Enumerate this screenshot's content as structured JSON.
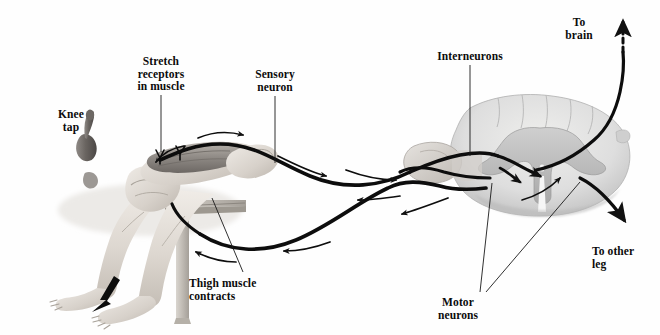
{
  "figure": {
    "background_color": "#fefefe",
    "width": 660,
    "height": 335,
    "ink_color": "#111111",
    "tissue_fill": "#d8d8d8",
    "tissue_shade": "#b4b4b4",
    "skin_fill": "#e3e0dc"
  },
  "labels": [
    {
      "id": "knee-tap",
      "text": "Knee\ntap",
      "x": 70,
      "y": 108,
      "align": "center",
      "leader": "none"
    },
    {
      "id": "stretch-receptors",
      "text": "Stretch\nreceptors\nin muscle",
      "x": 129,
      "y": 55,
      "align": "center",
      "leader": "vertical-down"
    },
    {
      "id": "sensory-neuron",
      "text": "Sensory\nneuron",
      "x": 248,
      "y": 68,
      "align": "center",
      "leader": "vertical-down"
    },
    {
      "id": "interneurons",
      "text": "Interneurons",
      "x": 437,
      "y": 50,
      "align": "center",
      "leader": "vertical-down"
    },
    {
      "id": "to-brain",
      "text": "To\nbrain",
      "x": 568,
      "y": 16,
      "align": "center",
      "leader": "dashed-arrow-up"
    },
    {
      "id": "to-other-leg",
      "text": "To other\nleg",
      "x": 592,
      "y": 245,
      "align": "left",
      "leader": "arrow-down-right"
    },
    {
      "id": "motor-neurons",
      "text": "Motor\nneurons",
      "x": 446,
      "y": 296,
      "align": "center",
      "leader": "two-lines-up"
    },
    {
      "id": "thigh-muscle-contracts",
      "text": "Thigh muscle\ncontracts",
      "x": 189,
      "y": 277,
      "align": "left",
      "leader": "diagonal-up-right"
    }
  ],
  "pathways": [
    {
      "id": "sensory-pathway",
      "name": "Sensory neuron pathway",
      "direction": "leg-to-spinal-cord",
      "arrow_direction": "right",
      "style": "solid-thick"
    },
    {
      "id": "motor-pathway",
      "name": "Motor neuron pathway",
      "direction": "spinal-cord-to-leg",
      "arrow_direction": "left",
      "style": "solid-thick"
    },
    {
      "id": "ascending-to-brain",
      "name": "Ascending tract to brain",
      "direction": "upward",
      "arrow_direction": "up",
      "style": "dashed"
    },
    {
      "id": "crossed-extensor",
      "name": "Crossed pathway to other leg",
      "direction": "down-right",
      "arrow_direction": "down-right",
      "style": "solid-thick"
    },
    {
      "id": "leg-kick",
      "name": "Lower leg kick motion",
      "direction": "down-left",
      "arrow_direction": "down-left",
      "style": "solid-wedge"
    }
  ],
  "anatomy": [
    {
      "id": "reflex-hammer",
      "name": "Reflex hammer"
    },
    {
      "id": "seated-legs",
      "name": "Seated legs crossed at knee"
    },
    {
      "id": "bench",
      "name": "Bench / table edge"
    },
    {
      "id": "thigh-muscle",
      "name": "Quadriceps thigh muscle"
    },
    {
      "id": "muscle-spindle",
      "name": "Muscle spindle stretch receptor"
    },
    {
      "id": "spinal-cord",
      "name": "Spinal cord cross-section"
    },
    {
      "id": "gray-matter",
      "name": "Butterfly-shaped gray matter"
    },
    {
      "id": "dorsal-root-ganglion",
      "name": "Dorsal root ganglion"
    },
    {
      "id": "ventral-horn",
      "name": "Ventral horn motor neuron cell bodies"
    },
    {
      "id": "central-canal",
      "name": "Central canal"
    }
  ]
}
